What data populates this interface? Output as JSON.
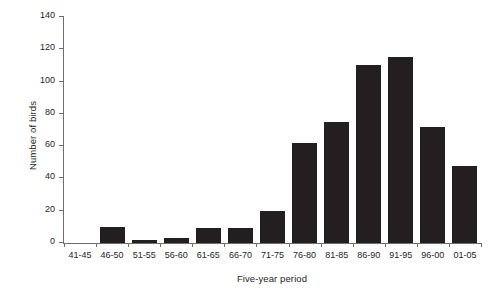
{
  "chart_data": {
    "type": "bar",
    "title": "",
    "subtitle": "",
    "xlabel": "Five-year period",
    "ylabel": "Number of birds",
    "categories": [
      "41-45",
      "46-50",
      "51-55",
      "56-60",
      "61-65",
      "66-70",
      "71-75",
      "76-80",
      "81-85",
      "86-90",
      "91-95",
      "96-00",
      "01-05"
    ],
    "values": [
      0,
      10,
      2,
      3,
      9,
      9,
      20,
      62,
      75,
      110,
      115,
      72,
      48
    ],
    "ylim": [
      0,
      140
    ],
    "ytick_values": [
      0,
      20,
      40,
      60,
      80,
      100,
      120,
      140
    ],
    "ytick_labels": [
      "0",
      "20",
      "40",
      "60",
      "80",
      "100",
      "120",
      "140"
    ],
    "grid": false,
    "legend": false,
    "legend_position": "none",
    "bar_color": "#231f20",
    "axis_color": "#6d6e71"
  }
}
